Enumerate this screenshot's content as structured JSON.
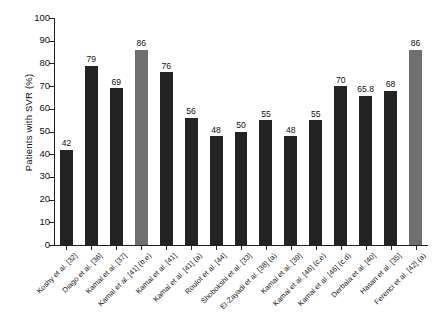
{
  "chart_data": {
    "type": "bar",
    "title": "",
    "xlabel": "",
    "ylabel": "Patients with SVR (%)",
    "ylim": [
      0,
      100
    ],
    "yticks": [
      0,
      10,
      20,
      30,
      40,
      50,
      60,
      70,
      80,
      90,
      100
    ],
    "ytick_labels": [
      "0",
      "10",
      "20",
      "30",
      "40",
      "50",
      "60",
      "70",
      "80",
      "90",
      "100"
    ],
    "grid": false,
    "legend": "none",
    "bar_colors": {
      "default": "#232323",
      "highlight": "#6f6f6f"
    },
    "categories": [
      "Koshy et al. [32]",
      "Diago et al. [36]",
      "Kamal et al. [37]",
      "Kamal et al. [41] (b,e)",
      "Kamal et al. [41]",
      "Kamal et al. [41] (a)",
      "Roulot et al. [44]",
      "Shobokshi et al. [33]",
      "El-Zayadi et al. [38] (a)",
      "Kamal et al. [39]",
      "Kamal et al. [46] (c,e)",
      "Kamal et al. [46] (c,d)",
      "Derbala et al. [40]",
      "Hasan et al. [35]",
      "Ferenci et al. [42] (a)"
    ],
    "values": [
      42,
      79,
      69,
      86,
      76,
      56,
      48,
      50,
      55,
      48,
      55,
      70,
      65.8,
      68,
      86
    ],
    "value_labels": [
      "42",
      "79",
      "69",
      "86",
      "76",
      "56",
      "48",
      "50",
      "55",
      "48",
      "55",
      "70",
      "65.8",
      "68",
      "86"
    ],
    "highlighted_indices": [
      3,
      14
    ]
  }
}
